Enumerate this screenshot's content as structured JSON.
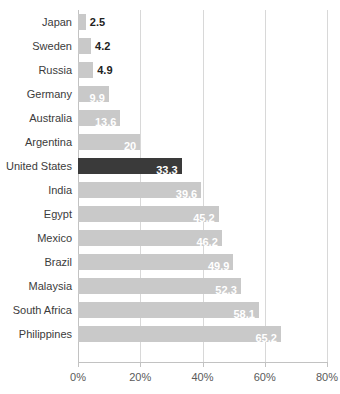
{
  "chart_data": {
    "type": "bar",
    "orientation": "horizontal",
    "title": "",
    "subtitle": "",
    "xlabel": "",
    "ylabel": "",
    "xlim": [
      0,
      80
    ],
    "grid": true,
    "legend": false,
    "value_suffix": "%",
    "categories": [
      "Japan",
      "Sweden",
      "Russia",
      "Germany",
      "Australia",
      "Argentina",
      "United States",
      "India",
      "Egypt",
      "Mexico",
      "Brazil",
      "Malaysia",
      "South Africa",
      "Philippines"
    ],
    "values": [
      2.5,
      4.2,
      4.9,
      9.9,
      13.6,
      20,
      33.3,
      39.6,
      45.2,
      46.2,
      49.9,
      52.3,
      58.1,
      65.2
    ],
    "value_labels": [
      "2.5",
      "4.2",
      "4.9",
      "9.9",
      "13.6",
      "20",
      "33.3",
      "39.6",
      "45.2",
      "46.2",
      "49.9",
      "52.3",
      "58.1",
      "65.2"
    ],
    "label_placement": [
      "outside",
      "outside",
      "outside",
      "inside",
      "inside",
      "inside",
      "inside",
      "inside",
      "inside",
      "inside",
      "inside",
      "inside",
      "inside",
      "inside"
    ],
    "highlight_index": 6,
    "xticks": [
      0,
      20,
      40,
      60,
      80
    ],
    "xtick_labels": [
      "0%",
      "20%",
      "40%",
      "60%",
      "80%"
    ],
    "colors": {
      "bar": "#c9c9c9",
      "bar_highlight": "#3a3a3a",
      "gridline": "#d8d8d8",
      "axis": "#c2c2c2",
      "category_label": "#3b3b3b",
      "tick_label": "#5a5a5a",
      "value_inside": "#ffffff",
      "value_outside": "#222222",
      "background": "#ffffff"
    }
  }
}
